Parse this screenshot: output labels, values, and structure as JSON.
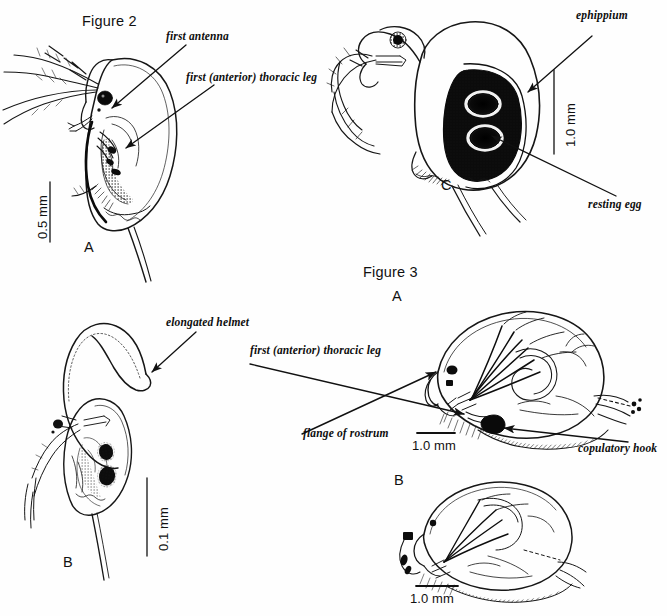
{
  "plate": {
    "width": 667,
    "height": 616,
    "background": "#fefefe",
    "ink": "#111111"
  },
  "figures": [
    {
      "id": "figure-2",
      "title": "Figure 2"
    },
    {
      "id": "figure-3",
      "title": "Figure 3"
    }
  ],
  "figure2": {
    "title": "Figure 2",
    "panels": {
      "a": {
        "letter": "A",
        "subject": "adult female Daphnia, lateral view",
        "scale": {
          "value": "0.5 mm",
          "orientation": "vertical"
        },
        "callouts": [
          {
            "name": "first-antenna",
            "text": "first antenna"
          },
          {
            "name": "first-thoracic-leg",
            "text": "first (anterior) thoracic leg"
          }
        ]
      },
      "b": {
        "letter": "B",
        "subject": "Daphnia with elongated helmet, lateral view",
        "scale": {
          "value": "0.1 mm",
          "orientation": "vertical"
        },
        "callouts": [
          {
            "name": "elongated-helmet",
            "text": "elongated helmet"
          }
        ]
      },
      "c": {
        "letter": "C",
        "subject": "Daphnia bearing ephippium with resting eggs",
        "scale": {
          "value": "1.0 mm",
          "orientation": "vertical"
        },
        "callouts": [
          {
            "name": "ephippium",
            "text": "ephippium"
          },
          {
            "name": "resting-egg",
            "text": "resting egg"
          }
        ]
      }
    }
  },
  "figure3": {
    "title": "Figure 3",
    "panels": {
      "a": {
        "letter": "A",
        "subject": "male cladoceran, lateral view",
        "scale": {
          "value": "1.0 mm",
          "orientation": "horizontal"
        },
        "callouts": [
          {
            "name": "first-thoracic-leg",
            "text": "first (anterior) thoracic leg"
          },
          {
            "name": "flange-of-rostrum",
            "text": "flange of rostrum"
          },
          {
            "name": "copulatory-hook",
            "text": "copulatory hook"
          }
        ]
      },
      "b": {
        "letter": "B",
        "subject": "male cladoceran, second species, lateral view",
        "scale": {
          "value": "1.0 mm",
          "orientation": "horizontal"
        },
        "callouts": []
      }
    }
  },
  "labels": {
    "figure2_title": "Figure 2",
    "figure3_title": "Figure 3",
    "first_antenna": "first antenna",
    "first_thoracic_leg_f2": "first (anterior) thoracic leg",
    "ephippium": "ephippium",
    "resting_egg": "resting egg",
    "elongated_helmet": "elongated helmet",
    "first_thoracic_leg_f3": "first (anterior) thoracic leg",
    "flange_of_rostrum": "flange of rostrum",
    "copulatory_hook": "copulatory hook",
    "panel_a_f2": "A",
    "panel_b_f2": "B",
    "panel_c_f2": "C",
    "panel_a_f3": "A",
    "panel_b_f3": "B",
    "scale_05mm": "0.5 mm",
    "scale_01mm": "0.1 mm",
    "scale_10mm_c": "1.0 mm",
    "scale_10mm_f3a": "1.0 mm",
    "scale_10mm_f3b": "1.0 mm"
  }
}
